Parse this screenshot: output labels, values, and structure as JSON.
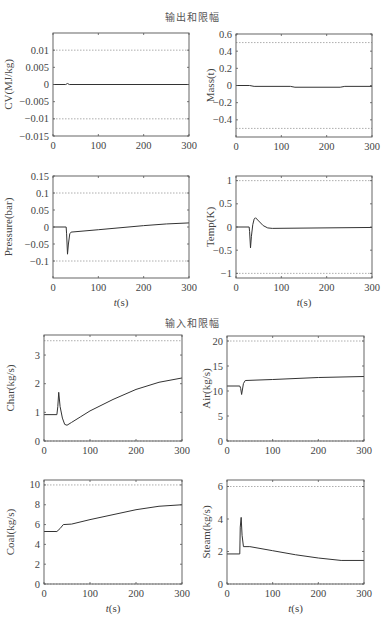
{
  "sections": {
    "outputs_title": "输出和限幅",
    "inputs_title": "输入和限幅"
  },
  "chart_data": [
    {
      "type": "line",
      "title": "",
      "xlabel": "",
      "ylabel": "CV(MJ/kg)",
      "xlim": [
        0,
        300
      ],
      "ylim": [
        -0.015,
        0.015
      ],
      "xticks": [
        0,
        100,
        200,
        300
      ],
      "yticks": [
        0.01,
        0.005,
        0,
        -0.005,
        -0.01,
        -0.015
      ],
      "ytick_labels": [
        "0.01",
        "0.005",
        "0",
        "−0.005",
        "−0.01",
        "−0.015"
      ],
      "limits": [
        0.01,
        -0.01
      ],
      "series": [
        {
          "name": "CV",
          "x": [
            0,
            28,
            32,
            36,
            300
          ],
          "y": [
            0,
            0,
            0.0003,
            0,
            0
          ]
        }
      ],
      "frame": {
        "x0": 53,
        "x1": 189,
        "y0": 33,
        "y1": 136
      }
    },
    {
      "type": "line",
      "title": "",
      "xlabel": "",
      "ylabel": "Mass(t)",
      "xlim": [
        0,
        300
      ],
      "ylim": [
        -0.6,
        0.6
      ],
      "xticks": [
        0,
        100,
        200,
        300
      ],
      "yticks": [
        0.6,
        0.4,
        0.2,
        0,
        -0.2,
        -0.4
      ],
      "ytick_labels": [
        "0.6",
        "0.4",
        "0.2",
        "0",
        "−0.2",
        "−0.4"
      ],
      "limits": [
        0.5,
        -0.5
      ],
      "series": [
        {
          "name": "Mass",
          "x": [
            0,
            30,
            40,
            120,
            130,
            230,
            240,
            300
          ],
          "y": [
            0,
            0,
            -0.01,
            -0.01,
            -0.02,
            -0.02,
            -0.01,
            -0.01
          ]
        }
      ],
      "frame": {
        "x0": 236,
        "x1": 372,
        "y0": 34,
        "y1": 137
      }
    },
    {
      "type": "line",
      "title": "",
      "xlabel": "t(s)",
      "ylabel": "Pressure(bar)",
      "xlim": [
        0,
        300
      ],
      "ylim": [
        -0.15,
        0.15
      ],
      "xticks": [
        0,
        100,
        200,
        300
      ],
      "yticks": [
        0.15,
        0.1,
        0.05,
        0,
        -0.05,
        -0.1
      ],
      "ytick_labels": [
        "0.15",
        "0.1",
        "0.05",
        "0",
        "−0.05",
        "−0.1"
      ],
      "limits": [
        0.1,
        -0.1
      ],
      "series": [
        {
          "name": "Pressure",
          "x": [
            0,
            29,
            30,
            32,
            34,
            37,
            40,
            100,
            200,
            250,
            300
          ],
          "y": [
            0,
            0,
            -0.02,
            -0.08,
            -0.05,
            -0.02,
            -0.015,
            -0.008,
            0.004,
            0.009,
            0.012
          ]
        }
      ],
      "frame": {
        "x0": 53,
        "x1": 189,
        "y0": 176,
        "y1": 278
      }
    },
    {
      "type": "line",
      "title": "",
      "xlabel": "t(s)",
      "ylabel": "Temp(K)",
      "xlim": [
        0,
        300
      ],
      "ylim": [
        -1.1,
        1.1
      ],
      "xticks": [
        0,
        100,
        200,
        300
      ],
      "yticks": [
        1,
        0.5,
        0,
        -0.5,
        -1
      ],
      "ytick_labels": [
        "1",
        "0.5",
        "0",
        "−0.5",
        "−1"
      ],
      "limits": [
        1,
        -1
      ],
      "series": [
        {
          "name": "Temp",
          "x": [
            0,
            29,
            30,
            32,
            34,
            37,
            40,
            43,
            50,
            60,
            70,
            80,
            300
          ],
          "y": [
            0,
            0,
            -0.1,
            -0.45,
            -0.2,
            0.05,
            0.17,
            0.2,
            0.13,
            0.03,
            -0.02,
            -0.03,
            -0.01
          ]
        }
      ],
      "frame": {
        "x0": 236,
        "x1": 372,
        "y0": 176,
        "y1": 278
      }
    },
    {
      "type": "line",
      "title": "",
      "xlabel": "",
      "ylabel": "Char(kg/s)",
      "xlim": [
        0,
        300
      ],
      "ylim": [
        0,
        3.7
      ],
      "xticks": [
        0,
        100,
        200,
        300
      ],
      "yticks": [
        3,
        2,
        1,
        0
      ],
      "ytick_labels": [
        "3",
        "2",
        "1",
        "0"
      ],
      "limits": [
        3.5,
        0
      ],
      "series": [
        {
          "name": "Char",
          "x": [
            0,
            28,
            30,
            32,
            35,
            40,
            45,
            50,
            60,
            80,
            100,
            150,
            200,
            250,
            300
          ],
          "y": [
            0.92,
            0.92,
            1.2,
            1.7,
            1.2,
            0.8,
            0.58,
            0.55,
            0.65,
            0.85,
            1.05,
            1.45,
            1.8,
            2.05,
            2.2
          ]
        }
      ],
      "frame": {
        "x0": 44,
        "x1": 182,
        "y0": 335,
        "y1": 441
      }
    },
    {
      "type": "line",
      "title": "",
      "xlabel": "",
      "ylabel": "Air(kg/s)",
      "xlim": [
        0,
        300
      ],
      "ylim": [
        0,
        21
      ],
      "xticks": [
        0,
        100,
        200,
        300
      ],
      "yticks": [
        20,
        15,
        10,
        5,
        0
      ],
      "ytick_labels": [
        "20",
        "15",
        "10",
        "5",
        "0"
      ],
      "limits": [
        20,
        0
      ],
      "series": [
        {
          "name": "Air",
          "x": [
            0,
            28,
            30,
            32,
            36,
            40,
            100,
            200,
            300
          ],
          "y": [
            11,
            11,
            10.5,
            9.3,
            11.5,
            12.1,
            12.3,
            12.7,
            12.9
          ]
        }
      ],
      "frame": {
        "x0": 227,
        "x1": 364,
        "y0": 336,
        "y1": 441
      }
    },
    {
      "type": "line",
      "title": "",
      "xlabel": "t(s)",
      "ylabel": "Coal(kg/s)",
      "xlim": [
        0,
        300
      ],
      "ylim": [
        0,
        10.5
      ],
      "xticks": [
        0,
        100,
        200,
        300
      ],
      "yticks": [
        10,
        8,
        6,
        4,
        2,
        0
      ],
      "ytick_labels": [
        "10",
        "8",
        "6",
        "4",
        "2",
        "0"
      ],
      "limits": [
        10,
        0
      ],
      "series": [
        {
          "name": "Coal",
          "x": [
            0,
            28,
            35,
            42,
            60,
            100,
            150,
            200,
            250,
            300
          ],
          "y": [
            5.3,
            5.3,
            5.6,
            6.0,
            6.05,
            6.5,
            7.0,
            7.5,
            7.85,
            8.0
          ]
        }
      ],
      "frame": {
        "x0": 44,
        "x1": 182,
        "y0": 480,
        "y1": 584
      }
    },
    {
      "type": "line",
      "title": "",
      "xlabel": "t(s)",
      "ylabel": "Steam(kg/s)",
      "xlim": [
        0,
        300
      ],
      "ylim": [
        0,
        6.4
      ],
      "xticks": [
        0,
        100,
        200,
        300
      ],
      "yticks": [
        6,
        4,
        2,
        0
      ],
      "ytick_labels": [
        "6",
        "4",
        "2",
        "0"
      ],
      "limits": [
        6,
        0
      ],
      "series": [
        {
          "name": "Steam",
          "x": [
            0,
            28,
            29,
            31,
            33,
            36,
            50,
            100,
            150,
            200,
            250,
            300
          ],
          "y": [
            1.85,
            1.85,
            3.5,
            4.1,
            3.0,
            2.3,
            2.3,
            2.05,
            1.8,
            1.6,
            1.45,
            1.45
          ]
        }
      ],
      "frame": {
        "x0": 227,
        "x1": 364,
        "y0": 480,
        "y1": 584
      }
    }
  ]
}
